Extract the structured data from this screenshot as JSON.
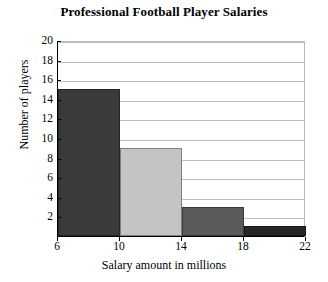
{
  "chart_data": {
    "type": "bar",
    "title": "Professional Football Player Salaries",
    "xlabel": "Salary amount in millions",
    "ylabel": "Number of players",
    "categories": [
      "6-10",
      "10-14",
      "14-18",
      "18-22"
    ],
    "values": [
      15,
      9,
      3,
      1
    ],
    "bin_edges": [
      6,
      10,
      14,
      18,
      22
    ],
    "bar_colors": [
      "#3a3a3a",
      "#c4c4c4",
      "#5a5a5a",
      "#262626"
    ],
    "xlim": [
      6,
      22
    ],
    "ylim": [
      0,
      20
    ],
    "xticks": [
      6,
      10,
      14,
      18,
      22
    ],
    "xtick_labels": [
      "6",
      "10",
      "14",
      "18",
      "22"
    ],
    "yticks": [
      2,
      4,
      6,
      8,
      10,
      12,
      14,
      16,
      18,
      20
    ],
    "ytick_labels": [
      "2",
      "4",
      "6",
      "8",
      "10",
      "12",
      "14",
      "16",
      "18",
      "20"
    ],
    "grid": true,
    "grid_axis": "y",
    "grid_color": "#bfbfbf",
    "legend": null,
    "legend_position": "none",
    "background_color": "#ffffff",
    "axis_color": "#000000"
  }
}
